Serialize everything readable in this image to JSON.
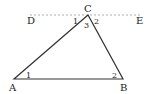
{
  "diagram": {
    "points": {
      "A": {
        "label": "A",
        "x": 14,
        "y": 79
      },
      "B": {
        "label": "B",
        "x": 123,
        "y": 79
      },
      "C": {
        "label": "C",
        "x": 88,
        "y": 15
      },
      "D": {
        "label": "D",
        "x": 30,
        "y": 15
      },
      "E": {
        "label": "E",
        "x": 142,
        "y": 15
      }
    },
    "angle_labels": {
      "A1": "1",
      "B2": "2",
      "C1": "1",
      "C2": "2",
      "C3": "3"
    },
    "colors": {
      "stroke": "#333333",
      "dashed": "#999999"
    }
  }
}
